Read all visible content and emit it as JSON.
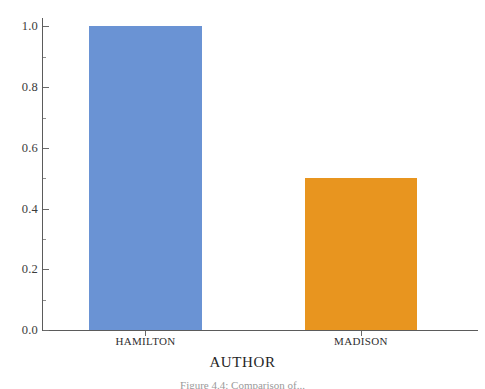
{
  "chart_data": {
    "type": "bar",
    "title": "",
    "subtitle": "",
    "categories": [
      "HAMILTON",
      "MADISON"
    ],
    "values": [
      1.0,
      0.5
    ],
    "bar_colors": [
      "#6a93d4",
      "#e8951f"
    ],
    "xlabel": "AUTHOR",
    "ylabel": "",
    "ylim": [
      0.0,
      1.0
    ],
    "xlim_categories": 2,
    "ytick_labels": [
      "0.0",
      "0.2",
      "0.4",
      "0.6",
      "0.8",
      "1.0"
    ],
    "ytick_values": [
      0.0,
      0.2,
      0.4,
      0.6,
      0.8,
      1.0
    ],
    "yminor_tick_values": [
      0.1,
      0.3,
      0.5,
      0.7,
      0.9
    ],
    "grid": false,
    "legend": "none",
    "axis_color": "#5b5b5b",
    "series": [
      {
        "name": "AUTHOR",
        "points": [
          {
            "category": "HAMILTON",
            "value": 1.0,
            "color": "#6a93d4"
          },
          {
            "category": "MADISON",
            "value": 0.5,
            "color": "#e8951f"
          }
        ]
      }
    ]
  },
  "figure": {
    "caption": "Figure 4.4: Comparison of...",
    "background_color": "#ffffff"
  }
}
